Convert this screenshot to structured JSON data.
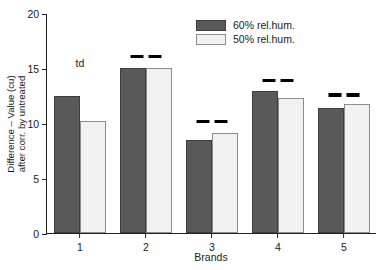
{
  "chart_data": {
    "type": "bar",
    "title": "",
    "xlabel": "Brands",
    "ylabel_line1": "Difference – Value (cu)",
    "ylabel_line2": "after corr. by untreated",
    "categories": [
      "1",
      "2",
      "3",
      "4",
      "5"
    ],
    "yticks": [
      "0",
      "5",
      "10",
      "15",
      "20"
    ],
    "ytick_values": [
      0,
      5,
      10,
      15,
      20
    ],
    "ylim": [
      0,
      20
    ],
    "grid": false,
    "legend_position": "top-right",
    "series": [
      {
        "name": "60% rel.hum.",
        "color": "#595959",
        "edge_color": "#3d3d3d",
        "values": [
          12.5,
          15.0,
          8.5,
          12.9,
          11.4
        ]
      },
      {
        "name": "50% rel.hum.",
        "color": "#f1f1f1",
        "edge_color": "#8c8c8c",
        "values": [
          10.2,
          15.0,
          9.1,
          12.3,
          11.7
        ]
      }
    ],
    "annotations": [
      {
        "text": "td",
        "category": "1",
        "y": 16.0
      }
    ],
    "significance_marks": [
      {
        "category": "2",
        "count": 2,
        "y": 16.3
      },
      {
        "category": "3",
        "count": 2,
        "y": 10.4
      },
      {
        "category": "4",
        "count": 2,
        "y": 14.1
      },
      {
        "category": "5",
        "count": 2,
        "y": 12.8
      }
    ]
  }
}
